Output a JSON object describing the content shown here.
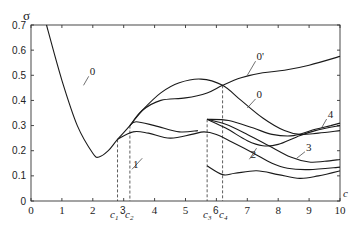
{
  "chart_data": {
    "type": "line",
    "title": "",
    "xlabel": "c",
    "ylabel": "σ",
    "xlim": [
      0,
      10
    ],
    "ylim": [
      0,
      0.7
    ],
    "grid": false,
    "x_ticks": [
      "0",
      "1",
      "2",
      "3",
      "4",
      "5",
      "6",
      "7",
      "8",
      "9",
      "10"
    ],
    "y_ticks": [
      "0",
      "0.1",
      "0.2",
      "0.3",
      "0.4",
      "0.5",
      "0.6",
      "0.7"
    ],
    "critical_points": [
      {
        "label": "c1",
        "x": 2.8
      },
      {
        "label": "c2",
        "x": 3.2
      },
      {
        "label": "c3",
        "x": 5.7
      },
      {
        "label": "c4",
        "x": 6.2
      }
    ],
    "series": [
      {
        "name": "0",
        "points": [
          [
            0.5,
            0.7
          ],
          [
            1.0,
            0.48
          ],
          [
            1.5,
            0.3
          ],
          [
            2.0,
            0.19
          ],
          [
            2.2,
            0.175
          ],
          [
            2.5,
            0.2
          ],
          [
            2.8,
            0.245
          ],
          [
            3.2,
            0.3
          ],
          [
            3.6,
            0.36
          ],
          [
            4.2,
            0.43
          ],
          [
            4.8,
            0.47
          ],
          [
            5.5,
            0.485
          ],
          [
            6.2,
            0.46
          ],
          [
            6.8,
            0.4
          ],
          [
            7.5,
            0.33
          ],
          [
            8.2,
            0.28
          ],
          [
            8.7,
            0.265
          ],
          [
            9.3,
            0.27
          ],
          [
            10,
            0.28
          ]
        ]
      },
      {
        "name": "0'",
        "points": [
          [
            3.2,
            0.3
          ],
          [
            3.6,
            0.36
          ],
          [
            4.2,
            0.4
          ],
          [
            5.0,
            0.41
          ],
          [
            5.7,
            0.43
          ],
          [
            6.2,
            0.46
          ],
          [
            6.8,
            0.49
          ],
          [
            7.5,
            0.51
          ],
          [
            8.2,
            0.52
          ],
          [
            9.0,
            0.54
          ],
          [
            10,
            0.575
          ]
        ]
      },
      {
        "name": "1",
        "points": [
          [
            2.8,
            0.245
          ],
          [
            3.3,
            0.275
          ],
          [
            3.8,
            0.27
          ],
          [
            4.5,
            0.25
          ],
          [
            5.2,
            0.265
          ],
          [
            5.6,
            0.275
          ],
          [
            6.0,
            0.265
          ],
          [
            6.5,
            0.235
          ],
          [
            7.2,
            0.19
          ],
          [
            7.8,
            0.15
          ],
          [
            8.3,
            0.13
          ],
          [
            9.0,
            0.125
          ],
          [
            10,
            0.135
          ]
        ]
      },
      {
        "name": "upper-branch-after-c2",
        "points": [
          [
            3.2,
            0.3
          ],
          [
            3.4,
            0.315
          ],
          [
            4.0,
            0.3
          ],
          [
            4.8,
            0.275
          ],
          [
            5.4,
            0.28
          ]
        ]
      },
      {
        "name": "lower-branch",
        "points": [
          [
            5.7,
            0.14
          ],
          [
            6.2,
            0.105
          ],
          [
            6.6,
            0.11
          ],
          [
            7.3,
            0.12
          ],
          [
            8.0,
            0.105
          ],
          [
            8.7,
            0.09
          ],
          [
            9.3,
            0.1
          ],
          [
            10,
            0.12
          ]
        ]
      },
      {
        "name": "2",
        "points": [
          [
            5.7,
            0.325
          ],
          [
            6.3,
            0.29
          ],
          [
            7.0,
            0.24
          ],
          [
            7.5,
            0.22
          ],
          [
            8.0,
            0.225
          ],
          [
            8.6,
            0.255
          ],
          [
            9.2,
            0.28
          ],
          [
            10,
            0.3
          ]
        ]
      },
      {
        "name": "3",
        "points": [
          [
            5.7,
            0.325
          ],
          [
            6.3,
            0.305
          ],
          [
            7.0,
            0.265
          ],
          [
            7.7,
            0.22
          ],
          [
            8.4,
            0.175
          ],
          [
            9.0,
            0.155
          ],
          [
            9.5,
            0.158
          ],
          [
            10,
            0.165
          ]
        ]
      },
      {
        "name": "4",
        "points": [
          [
            5.7,
            0.325
          ],
          [
            6.4,
            0.32
          ],
          [
            7.2,
            0.29
          ],
          [
            7.8,
            0.265
          ],
          [
            8.5,
            0.26
          ],
          [
            9.2,
            0.285
          ],
          [
            9.7,
            0.3
          ],
          [
            10,
            0.31
          ]
        ]
      }
    ],
    "curve_labels": [
      {
        "text": "0",
        "x": 1.9,
        "y": 0.5
      },
      {
        "text": "0'",
        "x": 7.3,
        "y": 0.56
      },
      {
        "text": "0",
        "x": 7.3,
        "y": 0.41
      },
      {
        "text": "1",
        "x": 3.3,
        "y": 0.13
      },
      {
        "text": "2",
        "x": 7.1,
        "y": 0.17
      },
      {
        "text": "3",
        "x": 8.9,
        "y": 0.2
      },
      {
        "text": "4",
        "x": 9.6,
        "y": 0.33
      }
    ]
  },
  "labels": {
    "y_axis": "σ",
    "x_axis": "c",
    "c1": "c",
    "c1_sub": "1",
    "c2": "c",
    "c2_sub": "2",
    "c3": "c",
    "c3_sub": "3",
    "c4": "c",
    "c4_sub": "4",
    "tick3": "3",
    "tick6": "6"
  }
}
